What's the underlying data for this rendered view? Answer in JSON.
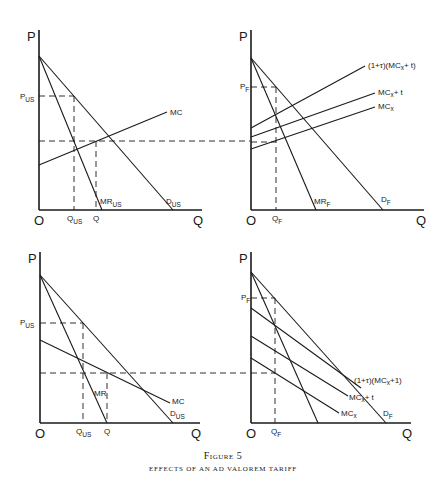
{
  "figure": {
    "title": "Figure 5",
    "subtitle": "EFFECTS OF AN AD VALOREM TARIFF"
  },
  "panels": [
    {
      "id": "top-left",
      "axis_y": "P",
      "axis_x": "Q",
      "origin": "O",
      "labels": {
        "price": "P",
        "price_sub": "US",
        "mc": "MC",
        "mr": "MR",
        "mr_sub": "US",
        "d": "D",
        "d_sub": "US",
        "qus": "Q",
        "qus_sub": "US",
        "q": "Q"
      }
    },
    {
      "id": "top-right",
      "axis_y": "P",
      "axis_x": "Q",
      "origin": "O",
      "labels": {
        "price": "P",
        "price_sub": "F",
        "curve1": "(1+τ)(MC",
        "curve1_sub": "x",
        "curve1_end": "+ t)",
        "curve2": "MC",
        "curve2_sub": "x",
        "curve2_end": "+ t",
        "curve3": "MC",
        "curve3_sub": "x",
        "mr": "MR",
        "mr_sub": "F",
        "d": "D",
        "d_sub": "F",
        "qf": "Q",
        "qf_sub": "F"
      }
    },
    {
      "id": "bottom-left",
      "axis_y": "P",
      "axis_x": "Q",
      "origin": "O",
      "labels": {
        "price": "P",
        "price_sub": "US",
        "mc": "MC",
        "mr": "MR",
        "d": "D",
        "d_sub": "US",
        "qus": "Q",
        "qus_sub": "US",
        "q": "Q"
      }
    },
    {
      "id": "bottom-right",
      "axis_y": "P",
      "axis_x": "Q",
      "origin": "O",
      "labels": {
        "price": "P",
        "price_sub": "F",
        "curve1": "(1+τ)(MC",
        "curve1_sub": "x",
        "curve1_end": "+1)",
        "curve2": "MC",
        "curve2_sub": "x",
        "curve2_end": "+ t",
        "curve3": "MC",
        "curve3_sub": "x",
        "d": "D",
        "d_sub": "F",
        "qf": "Q",
        "qf_sub": "F"
      }
    }
  ]
}
